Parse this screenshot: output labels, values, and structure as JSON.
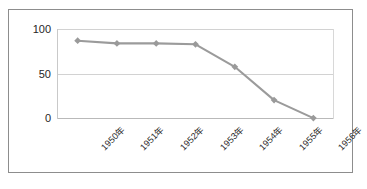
{
  "chart_data": {
    "type": "line",
    "title": "",
    "xlabel": "",
    "ylabel": "",
    "categories": [
      "1950年",
      "1951年",
      "1952年",
      "1953年",
      "1954年",
      "1955年",
      "1956年"
    ],
    "values": [
      87,
      84,
      84,
      83,
      58,
      21,
      1
    ],
    "series": [
      {
        "name": "",
        "values": [
          87,
          84,
          84,
          83,
          58,
          21,
          1
        ]
      }
    ],
    "ylim": [
      0,
      100
    ],
    "yticks": [
      "0",
      "50",
      "100"
    ],
    "ytick_values": [
      0,
      50,
      100
    ],
    "grid": true,
    "legend": false,
    "legend_position": "none",
    "marker": "diamond",
    "line_color": "#9b9b9b",
    "marker_color": "#9a9a9a",
    "grid_color": "#d2d2d2",
    "border_color": "#8d8d8d",
    "background": "#ffffff",
    "xtick_rotation": -45
  }
}
